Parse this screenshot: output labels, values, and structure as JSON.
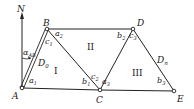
{
  "diagram": {
    "type": "triangulation-network",
    "north_label": "N",
    "azimuth_label": {
      "main": "α",
      "sub": "AB"
    },
    "points": [
      {
        "id": "A",
        "label": "A",
        "x": 22,
        "y": 88
      },
      {
        "id": "B",
        "label": "B",
        "x": 47,
        "y": 29
      },
      {
        "id": "C",
        "label": "C",
        "x": 100,
        "y": 90
      },
      {
        "id": "D",
        "label": "D",
        "x": 133,
        "y": 29
      },
      {
        "id": "E",
        "label": "E",
        "x": 174,
        "y": 91
      }
    ],
    "baselines": [
      {
        "label_main": "D",
        "label_sub": "0",
        "from": "A",
        "to": "B"
      },
      {
        "label_main": "D",
        "label_sub": "n",
        "from": "D",
        "to": "E"
      }
    ],
    "triangles": [
      {
        "label": "I"
      },
      {
        "label": "II"
      },
      {
        "label": "III"
      }
    ],
    "angles": [
      {
        "main": "a",
        "sub": "1"
      },
      {
        "main": "b",
        "sub": "1"
      },
      {
        "main": "c",
        "sub": "1"
      },
      {
        "main": "a",
        "sub": "2"
      },
      {
        "main": "b",
        "sub": "2"
      },
      {
        "main": "c",
        "sub": "2"
      },
      {
        "main": "a",
        "sub": "3"
      },
      {
        "main": "b",
        "sub": "3"
      },
      {
        "main": "c",
        "sub": "3"
      }
    ]
  }
}
